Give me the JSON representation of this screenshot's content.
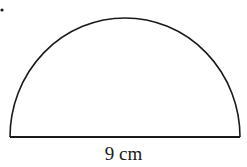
{
  "figure": {
    "shape": "semicircle",
    "diameter_label": "9 cm",
    "stroke_color": "#1a1a1a",
    "background": "#ffffff"
  }
}
